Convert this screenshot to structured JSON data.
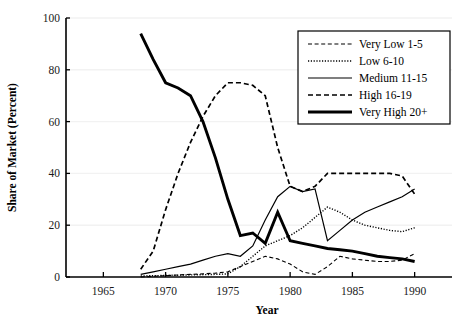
{
  "figure": {
    "partial_caption_top": "",
    "y_axis_title": "Share of Market (Percent)",
    "x_axis_title": "Year",
    "y_ticks": [
      0,
      20,
      40,
      60,
      80,
      100
    ],
    "x_ticks": [
      1965,
      1970,
      1975,
      1980,
      1985,
      1990
    ],
    "legend_items": [
      {
        "label": "Very Low 1-5",
        "style": "thin-dashed"
      },
      {
        "label": "Low 6-10",
        "style": "dotted"
      },
      {
        "label": "Medium 11-15",
        "style": "thin-solid"
      },
      {
        "label": "High 16-19",
        "style": "dashed"
      },
      {
        "label": "Very High 20+",
        "style": "thick-solid"
      }
    ],
    "colors": {
      "ink": "#000000",
      "grid": "#f2f2f2",
      "axis": "#000000"
    }
  },
  "chart_data": {
    "type": "line",
    "title": "",
    "xlabel": "Year",
    "ylabel": "Share of Market (Percent)",
    "xlim": [
      1962,
      1993
    ],
    "ylim": [
      0,
      100
    ],
    "yticks": [
      0,
      20,
      40,
      60,
      80,
      100
    ],
    "xticks": [
      1965,
      1970,
      1975,
      1980,
      1985,
      1990
    ],
    "grid": "horizontal",
    "legend_position": "top-right",
    "x": [
      1968,
      1969,
      1970,
      1971,
      1972,
      1973,
      1974,
      1975,
      1976,
      1977,
      1978,
      1979,
      1980,
      1981,
      1982,
      1983,
      1984,
      1985,
      1986,
      1987,
      1988,
      1989,
      1990
    ],
    "series": [
      {
        "name": "Very Low 1-5",
        "style": "thin-dashed",
        "values": [
          0,
          0.3,
          0.5,
          0.8,
          1.0,
          1.2,
          1.5,
          2.0,
          4.0,
          6.0,
          8.0,
          7.0,
          5.0,
          2.0,
          1.0,
          4.0,
          8.0,
          7.0,
          6.5,
          6.0,
          6.0,
          6.5,
          9.0
        ]
      },
      {
        "name": "Low 6-10",
        "style": "dotted",
        "values": [
          0.4,
          0.5,
          0.6,
          0.7,
          0.8,
          0.9,
          1.0,
          1.2,
          4.0,
          8.0,
          12.0,
          14.0,
          16.0,
          19.0,
          23.0,
          27.0,
          25.0,
          22.0,
          20.0,
          19.0,
          18.0,
          17.5,
          19.0
        ]
      },
      {
        "name": "Medium 11-15",
        "style": "thin-solid",
        "values": [
          1.0,
          2.0,
          3.0,
          4.0,
          5.0,
          6.5,
          8.0,
          9.0,
          8.0,
          12.0,
          22.0,
          31.0,
          35.0,
          33.0,
          34.0,
          14.0,
          18.0,
          22.0,
          25.0,
          27.0,
          29.0,
          31.0,
          34.0
        ]
      },
      {
        "name": "High 16-19",
        "style": "dashed",
        "values": [
          3.0,
          10.0,
          26.0,
          40.0,
          52.0,
          62.0,
          70.0,
          75.0,
          75.0,
          74.0,
          70.0,
          50.0,
          35.0,
          33.0,
          35.0,
          40.0,
          40.0,
          40.0,
          40.0,
          40.0,
          40.0,
          39.0,
          32.0
        ]
      },
      {
        "name": "Very High 20+",
        "style": "thick-solid",
        "values": [
          94.0,
          84.0,
          75.0,
          73.0,
          70.0,
          60.0,
          46.0,
          30.0,
          16.0,
          17.0,
          13.0,
          25.0,
          14.0,
          13.0,
          12.0,
          11.0,
          10.5,
          10.0,
          9.0,
          8.0,
          7.5,
          7.0,
          6.0
        ]
      }
    ]
  }
}
